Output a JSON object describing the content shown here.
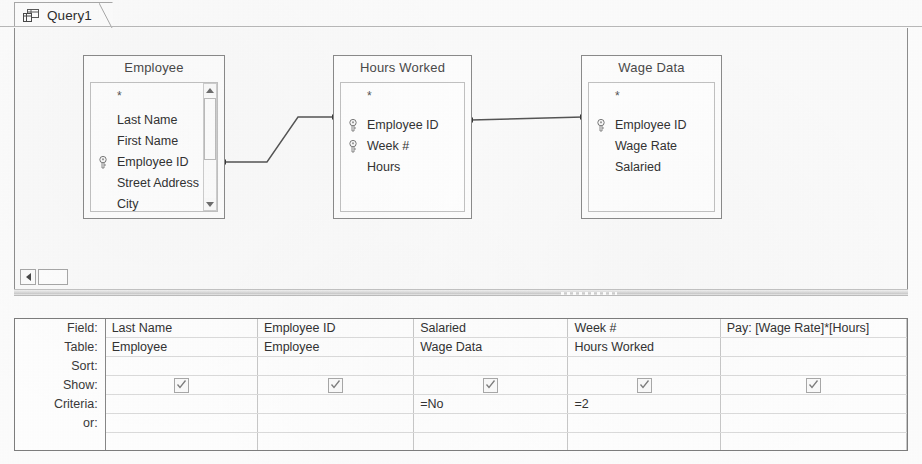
{
  "window": {
    "tab_label": "Query1",
    "tab_icon": "query-design-icon"
  },
  "diagram": {
    "tables": [
      {
        "name": "Employee",
        "fields": [
          {
            "label": "*",
            "key": false
          },
          {
            "label": "Last Name",
            "key": false
          },
          {
            "label": "First Name",
            "key": false
          },
          {
            "label": "Employee ID",
            "key": true
          },
          {
            "label": "Street Address",
            "key": false
          },
          {
            "label": "City",
            "key": false
          }
        ],
        "has_scrollbar": true
      },
      {
        "name": "Hours Worked",
        "fields": [
          {
            "label": "*",
            "key": false
          },
          {
            "label": "Employee ID",
            "key": true
          },
          {
            "label": "Week #",
            "key": true
          },
          {
            "label": "Hours",
            "key": false
          }
        ],
        "has_scrollbar": false
      },
      {
        "name": "Wage Data",
        "fields": [
          {
            "label": "*",
            "key": false
          },
          {
            "label": "Employee ID",
            "key": true
          },
          {
            "label": "Wage Rate",
            "key": false
          },
          {
            "label": "Salaried",
            "key": false
          }
        ],
        "has_scrollbar": false
      }
    ],
    "joins": [
      {
        "from_table": "Employee",
        "from_field": "Employee ID",
        "to_table": "Hours Worked",
        "to_field": "Employee ID"
      },
      {
        "from_table": "Hours Worked",
        "from_field": "Employee ID",
        "to_table": "Wage Data",
        "to_field": "Employee ID"
      }
    ]
  },
  "grid": {
    "row_labels": [
      "Field:",
      "Table:",
      "Sort:",
      "Show:",
      "Criteria:",
      "or:"
    ],
    "columns": [
      {
        "field": "Last Name",
        "table": "Employee",
        "sort": "",
        "show": true,
        "criteria": "",
        "or": ""
      },
      {
        "field": "Employee ID",
        "table": "Employee",
        "sort": "",
        "show": true,
        "criteria": "",
        "or": ""
      },
      {
        "field": "Salaried",
        "table": "Wage Data",
        "sort": "",
        "show": true,
        "criteria": "=No",
        "or": ""
      },
      {
        "field": "Week #",
        "table": "Hours Worked",
        "sort": "",
        "show": true,
        "criteria": "=2",
        "or": ""
      },
      {
        "field": "Pay: [Wage Rate]*[Hours]",
        "table": "",
        "sort": "",
        "show": true,
        "criteria": "",
        "or": ""
      }
    ]
  },
  "scrollbars": {
    "diagram_horizontal": {
      "left_arrow": "scroll-left-arrow",
      "thumb": "scroll-thumb"
    },
    "employee_vertical": {
      "up_arrow": "scroll-up-arrow",
      "down_arrow": "scroll-down-arrow",
      "thumb": "scroll-thumb"
    }
  },
  "colors": {
    "border": "#8b8b8b",
    "text": "#333333",
    "pane_bg": "#fbfbfb",
    "grid_line": "#c9c9c9"
  }
}
